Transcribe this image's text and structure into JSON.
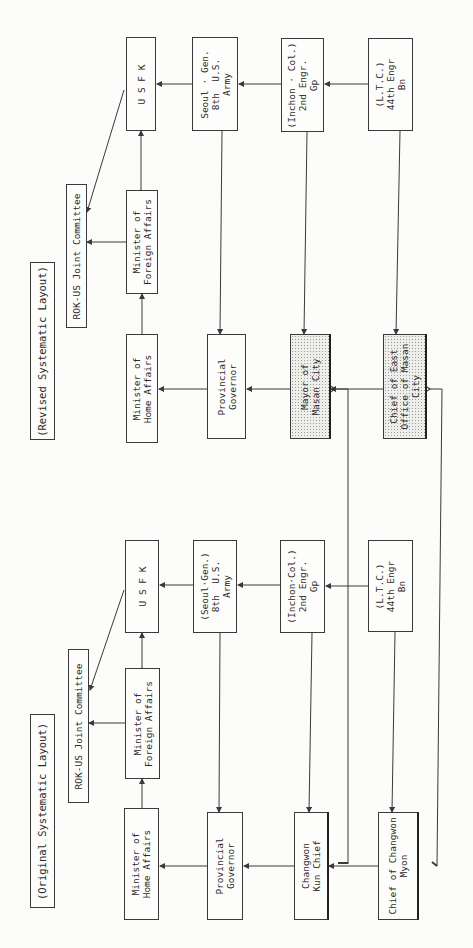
{
  "diagram": {
    "type": "organizational-flowchart",
    "orientation": "rotated-90-ccw",
    "revised_layout": {
      "title": "(Revised Systematic Layout)",
      "nodes": {
        "rok_us": "ROK-US Joint Committee",
        "min_foreign": "Minister of\nForeign Affairs",
        "usfk": "U S F K",
        "seoul": "Seoul · Gen.\n8th  U.S.\nArmy",
        "inchon": "(Inchon · Col.)\n2nd Engr.\nGp",
        "ltc": "(L.T.C.)\n44th Engr\nBn",
        "min_home": "Minister of\nHome Affairs",
        "prov_gov": "Provincial\nGovernor",
        "mayor": "Mayor of\nMasan City",
        "chief_east": "Chief of East\nOffice of Masan\nCity"
      }
    },
    "original_layout": {
      "title": "(Original Systematic Layout)",
      "nodes": {
        "rok_us": "ROK-US Joint Committee",
        "min_foreign": "Minister of\nForeign Affairs",
        "usfk": "U S F K",
        "seoul": "(Seoul·Gen.)\n8th  U.S.\nArmy",
        "inchon": "(Inchon·Col.)\n2nd Engr.\nGp",
        "ltc": "(L.T.C.)\n44th Engr\nBn",
        "min_home": "Minister of\nHome Affairs",
        "prov_gov": "Provincial\nGovernor",
        "kun_chief": "Changwon\nKun Chief",
        "myon_chief": "Chief of Changwon\nMyon"
      }
    },
    "colors": {
      "line": "#3a3a3a",
      "paper": "#fcfcfa",
      "shaded": "#eeeeea"
    }
  }
}
